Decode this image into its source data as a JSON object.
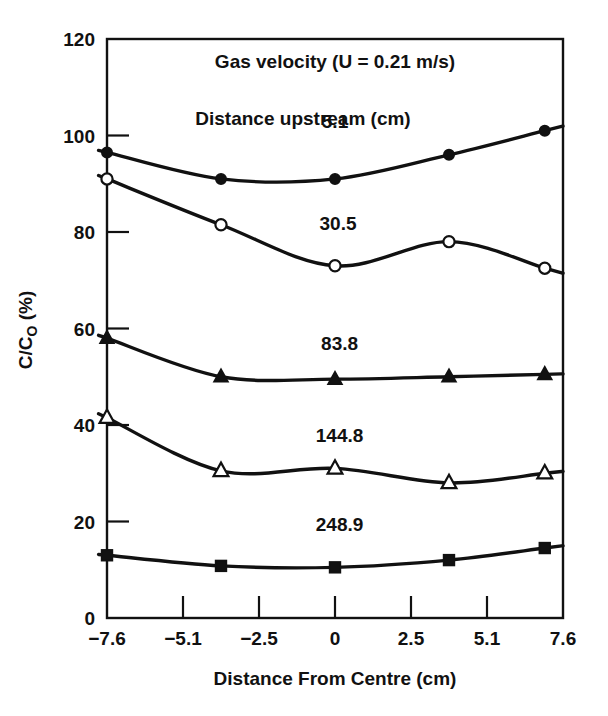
{
  "chart_data": {
    "type": "line",
    "title": "Gas velocity (U = 0.21 m/s)",
    "annotation": "Distance upstream (cm)",
    "xlabel": "Distance From Centre (cm)",
    "ylabel_main": "C/C",
    "ylabel_sub": "O",
    "ylabel_unit": " (%)",
    "ylabel_full": "C/CO (%)",
    "xlim": [
      -7.6,
      7.6
    ],
    "ylim": [
      0,
      120
    ],
    "grid": false,
    "legend_position": "inline-labels",
    "xticks": [
      -7.6,
      -5.1,
      -2.5,
      0,
      2.5,
      5.1,
      7.6
    ],
    "xtick_labels": [
      "-7.6",
      "-5.1",
      "-2.5",
      "0",
      "2.5",
      "5.1",
      "7.6"
    ],
    "yticks": [
      0,
      20,
      40,
      60,
      80,
      100,
      120
    ],
    "ytick_labels": [
      "0",
      "20",
      "40",
      "60",
      "80",
      "100",
      "120"
    ],
    "x": [
      -7.6,
      -3.8,
      0,
      3.8,
      7.0
    ],
    "series": [
      {
        "name": "5.1",
        "label": "5.1",
        "marker": "filled-circle",
        "values": [
          96.5,
          91.0,
          91.0,
          96.0,
          101.0
        ],
        "label_x": 0.0,
        "label_y": 101.5
      },
      {
        "name": "30.5",
        "label": "30.5",
        "marker": "open-circle",
        "values": [
          91.0,
          81.5,
          73.0,
          78.0,
          72.5
        ],
        "label_x": 0.1,
        "label_y": 80.5
      },
      {
        "name": "83.8",
        "label": "83.8",
        "marker": "filled-triangle",
        "values": [
          58.0,
          50.0,
          49.5,
          50.0,
          50.5
        ],
        "label_x": 0.15,
        "label_y": 55.5
      },
      {
        "name": "144.8",
        "label": "144.8",
        "marker": "open-triangle",
        "values": [
          41.5,
          30.5,
          31.0,
          28.0,
          30.0
        ],
        "label_x": 0.15,
        "label_y": 36.5
      },
      {
        "name": "248.9",
        "label": "248.9",
        "marker": "filled-square",
        "values": [
          13.0,
          10.8,
          10.5,
          12.0,
          14.5
        ],
        "label_x": 0.15,
        "label_y": 18.0
      }
    ],
    "colors": {
      "axis": "#111111",
      "curve": "#111111",
      "background": "#ffffff"
    }
  }
}
